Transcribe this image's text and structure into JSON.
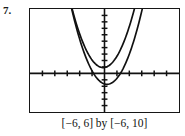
{
  "problem": {
    "number_label": "7."
  },
  "caption": {
    "text": "[−6, 6] by [−6, 10]",
    "x_range_label": "[−6, 6]",
    "connector": "by",
    "y_range_label": "[−6, 10]"
  },
  "chart_data": {
    "type": "line",
    "title": "",
    "subtitle": "",
    "xlabel": "",
    "ylabel": "",
    "xlim": [
      -6,
      6
    ],
    "ylim": [
      -6,
      10
    ],
    "grid": false,
    "legend": "none",
    "axis_style": "graphing-calculator",
    "x_axis_at_y": 0,
    "y_axis_at_x": 0,
    "x_tick_interval": 1,
    "y_tick_interval": 1,
    "x_ticks": [
      -5,
      -4,
      -3,
      -2,
      -1,
      1,
      2,
      3,
      4,
      5
    ],
    "y_ticks": [
      -5,
      -4,
      -3,
      -2,
      -1,
      1,
      2,
      3,
      4,
      5,
      6,
      7,
      8,
      9
    ],
    "tick_labels_visible": false,
    "series": [
      {
        "name": "upper-parabola",
        "kind": "parabola",
        "vertex": [
          -0.1,
          0.9
        ],
        "a": 1.45,
        "color": "#111111",
        "x": [
          -2.7,
          -2.4,
          -2.1,
          -1.8,
          -1.5,
          -1.2,
          -0.9,
          -0.6,
          -0.3,
          0,
          0.3,
          0.6,
          0.9,
          1.2,
          1.5,
          1.8,
          2.1,
          2.4,
          2.7
        ],
        "values": [
          10.0,
          8.3,
          6.7,
          5.4,
          4.2,
          3.2,
          2.4,
          1.8,
          1.4,
          1.2,
          1.1,
          1.3,
          1.7,
          2.4,
          3.2,
          4.3,
          5.6,
          7.1,
          8.8
        ]
      },
      {
        "name": "lower-parabola",
        "kind": "parabola",
        "vertex": [
          0.2,
          -1.7
        ],
        "a": 1.45,
        "color": "#111111",
        "x": [
          -2.7,
          -2.4,
          -2.1,
          -1.8,
          -1.5,
          -1.2,
          -0.9,
          -0.6,
          -0.3,
          0,
          0.3,
          0.6,
          0.9,
          1.2,
          1.5,
          1.8,
          2.1,
          2.4,
          2.7,
          3.0
        ],
        "values": [
          10.0,
          8.0,
          6.3,
          4.9,
          3.6,
          2.5,
          1.6,
          0.9,
          0.3,
          -0.1,
          -0.3,
          -0.4,
          -0.2,
          0.2,
          0.8,
          1.6,
          2.6,
          3.8,
          5.2,
          6.8
        ]
      }
    ]
  },
  "colors": {
    "frame": "#161616",
    "curve": "#111111",
    "axis": "#111111",
    "background": "#ffffff",
    "text": "#121212"
  }
}
